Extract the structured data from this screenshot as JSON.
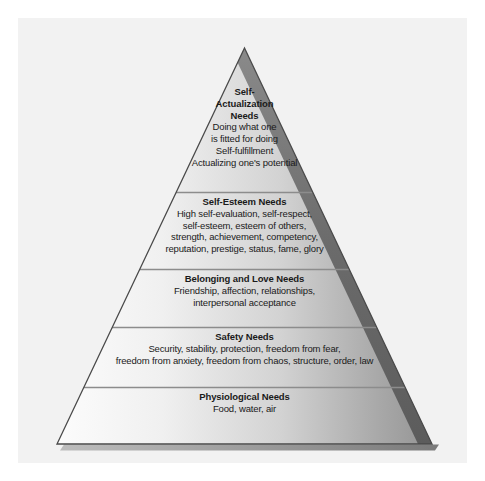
{
  "figure": {
    "name": "maslow-hierarchy-of-needs-pyramid",
    "shape": "pyramid",
    "background_color": "#ffffff",
    "panel_color": "#f2f2f2",
    "tier_gradient_from": "#fbfbfb",
    "tier_gradient_to": "#9a9a9a",
    "bevel_color": "#6e6e6e",
    "divider_color": "#8c8c8c",
    "outline_color": "#4a4a4a",
    "text_color": "#1a1a1a"
  },
  "tiers": [
    {
      "id": "self-actualization",
      "title_lines": [
        "Self-",
        "Actualization",
        "Needs"
      ],
      "desc_lines": [
        "Doing what one",
        "is fitted for doing",
        "Self-fulfillment",
        "Actualizing one's potential"
      ]
    },
    {
      "id": "self-esteem",
      "title_lines": [
        "Self-Esteem Needs"
      ],
      "desc_lines": [
        "High self-evaluation, self-respect,",
        "self-esteem, esteem of others,",
        "strength, achievement, competency,",
        "reputation, prestige, status, fame, glory"
      ]
    },
    {
      "id": "belonging",
      "title_lines": [
        "Belonging and Love Needs"
      ],
      "desc_lines": [
        "Friendship, affection, relationships,",
        "interpersonal acceptance"
      ]
    },
    {
      "id": "safety",
      "title_lines": [
        "Safety Needs"
      ],
      "desc_lines": [
        "Security, stability, protection, freedom from fear,",
        "freedom from anxiety, freedom from chaos, structure, order, law"
      ]
    },
    {
      "id": "physiological",
      "title_lines": [
        "Physiological Needs"
      ],
      "desc_lines": [
        "Food, water, air"
      ]
    }
  ]
}
